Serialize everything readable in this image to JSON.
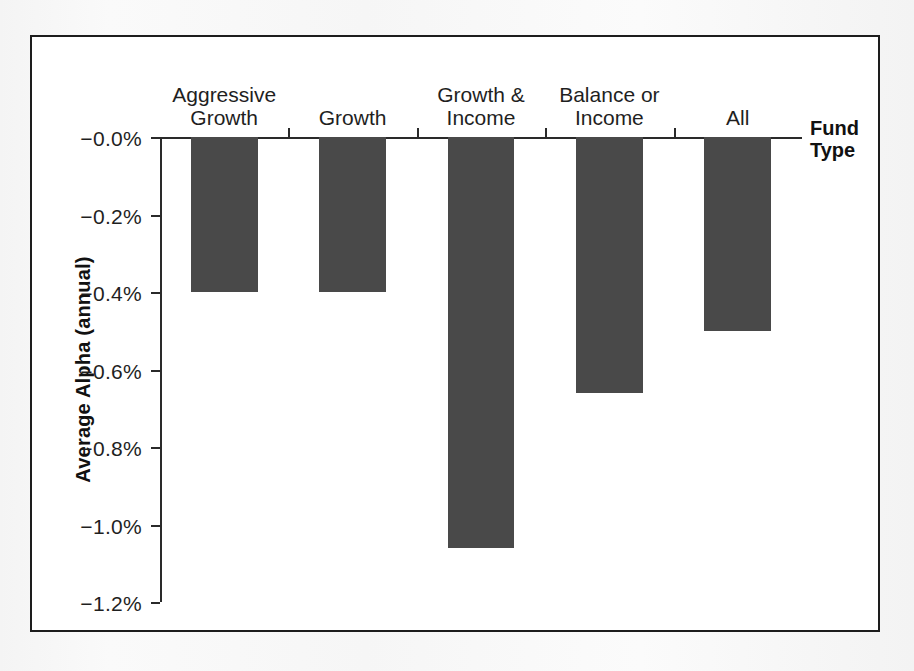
{
  "chart_data": {
    "type": "bar",
    "title": "",
    "subtitle": "",
    "xlabel": "Fund\nType",
    "ylabel": "Average Alpha (annual)",
    "categories": [
      "Aggressive\nGrowth",
      "Growth",
      "Growth &\nIncome",
      "Balance or\nIncome",
      "All"
    ],
    "values": [
      -0.4,
      -0.4,
      -1.06,
      -0.66,
      -0.5
    ],
    "value_labels": [
      "-0.40%",
      "-0.40%",
      "-1.06%",
      "-0.66%",
      "-0.50%"
    ],
    "ylim": [
      -1.2,
      0.0
    ],
    "y_tick_labels": [
      "−0.0%",
      "−0.2%",
      "−0.4%",
      "−0.6%",
      "−0.8%",
      "−1.0%",
      "−1.2%"
    ],
    "y_tick_values": [
      0.0,
      -0.2,
      -0.4,
      -0.6,
      -0.8,
      -1.0,
      -1.2
    ],
    "grid": false,
    "legend": false,
    "legend_position": "none",
    "bars_direction": "downward-from-zero-axis",
    "series": [
      {
        "name": "Average Alpha (annual)",
        "values": [
          -0.4,
          -0.4,
          -1.06,
          -0.66,
          -0.5
        ],
        "color": "#494949"
      }
    ],
    "colors": {
      "bar": "#494949",
      "axis": "#2a2a2a",
      "text": "#1f1f1f",
      "frame": "#1d1d1d",
      "plot_background": "#ffffff"
    }
  }
}
